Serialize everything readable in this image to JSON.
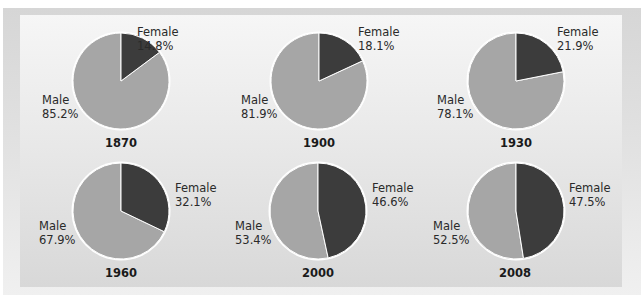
{
  "colors": {
    "male": "#a6a6a6",
    "female": "#3c3c3c",
    "separator": "#ffffff"
  },
  "chart_data": {
    "type": "pie",
    "title": "",
    "charts": [
      {
        "year": "1870",
        "slices": [
          {
            "label": "Female",
            "value": 14.8,
            "text": "14.8%"
          },
          {
            "label": "Male",
            "value": 85.2,
            "text": "85.2%"
          }
        ]
      },
      {
        "year": "1900",
        "slices": [
          {
            "label": "Female",
            "value": 18.1,
            "text": "18.1%"
          },
          {
            "label": "Male",
            "value": 81.9,
            "text": "81.9%"
          }
        ]
      },
      {
        "year": "1930",
        "slices": [
          {
            "label": "Female",
            "value": 21.9,
            "text": "21.9%"
          },
          {
            "label": "Male",
            "value": 78.1,
            "text": "78.1%"
          }
        ]
      },
      {
        "year": "1960",
        "slices": [
          {
            "label": "Female",
            "value": 32.1,
            "text": "32.1%"
          },
          {
            "label": "Male",
            "value": 67.9,
            "text": "67.9%"
          }
        ]
      },
      {
        "year": "2000",
        "slices": [
          {
            "label": "Female",
            "value": 46.6,
            "text": "46.6%"
          },
          {
            "label": "Male",
            "value": 53.4,
            "text": "53.4%"
          }
        ]
      },
      {
        "year": "2008",
        "slices": [
          {
            "label": "Female",
            "value": 47.5,
            "text": "47.5%"
          },
          {
            "label": "Male",
            "value": 52.5,
            "text": "52.5%"
          }
        ]
      }
    ],
    "legend": null
  },
  "layout": {
    "pies": [
      {
        "cx": 121,
        "cy": 81,
        "r": 48,
        "female_lbl": [
          137,
          25
        ],
        "male_lbl": [
          42,
          93
        ],
        "year_pos": [
          121,
          136
        ]
      },
      {
        "cx": 319,
        "cy": 81,
        "r": 48,
        "female_lbl": [
          358,
          25
        ],
        "male_lbl": [
          241,
          93
        ],
        "year_pos": [
          319,
          136
        ]
      },
      {
        "cx": 516,
        "cy": 81,
        "r": 48,
        "female_lbl": [
          557,
          25
        ],
        "male_lbl": [
          437,
          93
        ],
        "year_pos": [
          516,
          136
        ]
      },
      {
        "cx": 121,
        "cy": 211,
        "r": 48,
        "female_lbl": [
          175,
          181
        ],
        "male_lbl": [
          39,
          219
        ],
        "year_pos": [
          121,
          266
        ]
      },
      {
        "cx": 318,
        "cy": 211,
        "r": 48,
        "female_lbl": [
          372,
          181
        ],
        "male_lbl": [
          235,
          219
        ],
        "year_pos": [
          318,
          266
        ]
      },
      {
        "cx": 516,
        "cy": 211,
        "r": 48,
        "female_lbl": [
          569,
          181
        ],
        "male_lbl": [
          433,
          219
        ],
        "year_pos": [
          515,
          266
        ]
      }
    ]
  }
}
